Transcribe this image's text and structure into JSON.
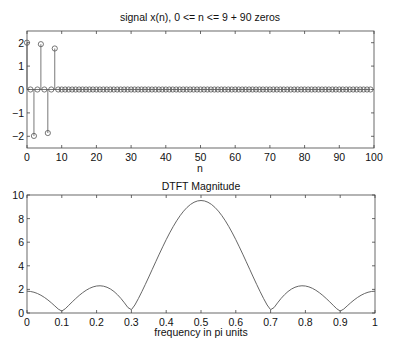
{
  "chart_data": [
    {
      "type": "stem",
      "title": "signal x(n), 0 <= n <= 9 + 90 zeros",
      "xlabel": "n",
      "ylabel": "",
      "xlim": [
        0,
        100
      ],
      "ylim": [
        -2.5,
        2.5
      ],
      "xticks": [
        0,
        10,
        20,
        30,
        40,
        50,
        60,
        70,
        80,
        90,
        100
      ],
      "yticks": [
        -2,
        -1,
        0,
        1,
        2
      ],
      "xtick_labels": [
        "0",
        "10",
        "20",
        "30",
        "40",
        "50",
        "60",
        "70",
        "80",
        "90",
        "100"
      ],
      "ytick_labels": [
        "-2",
        "-1",
        "0",
        "1",
        "2"
      ],
      "grid": false,
      "n_start": 0,
      "nonzero_samples": [
        2.0,
        0.0,
        -1.984,
        0.0,
        1.937,
        0.0,
        -1.86,
        0.0,
        1.753,
        0.0
      ],
      "zero_padding": 90
    },
    {
      "type": "line",
      "title": "DTFT Magnitude",
      "xlabel": "frequency in pi units",
      "ylabel": "",
      "xlim": [
        0,
        1
      ],
      "ylim": [
        0,
        10
      ],
      "xticks": [
        0,
        0.1,
        0.2,
        0.3,
        0.4,
        0.5,
        0.6,
        0.7,
        0.8,
        0.9,
        1
      ],
      "yticks": [
        0,
        2,
        4,
        6,
        8,
        10
      ],
      "xtick_labels": [
        "0",
        "0.1",
        "0.2",
        "0.3",
        "0.4",
        "0.5",
        "0.6",
        "0.7",
        "0.8",
        "0.9",
        "1"
      ],
      "ytick_labels": [
        "0",
        "2",
        "4",
        "6",
        "8",
        "10"
      ],
      "grid": false,
      "x_step": 0.01,
      "y_half": [
        9.534,
        9.497,
        9.386,
        9.203,
        8.95,
        8.631,
        8.249,
        7.811,
        7.321,
        6.787,
        6.214,
        5.611,
        4.986,
        4.346,
        3.7,
        3.055,
        2.421,
        1.806,
        1.22,
        0.679,
        0.279,
        0.463,
        0.859,
        1.23,
        1.552,
        1.82,
        2.029,
        2.18,
        2.272,
        2.307,
        2.287,
        2.214,
        2.093,
        1.928,
        1.724,
        1.488,
        1.225,
        0.943,
        0.65,
        0.361,
        0.163,
        0.329,
        0.598,
        0.862,
        1.106,
        1.322,
        1.505,
        1.652,
        1.759,
        1.824,
        1.846
      ],
      "note": "y_half gives |X| for f = 0.50 ... 1.00; magnitude is symmetric about f = 0.5"
    }
  ]
}
